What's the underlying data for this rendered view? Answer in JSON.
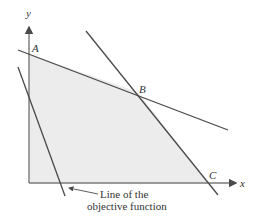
{
  "diagram": {
    "type": "linear-programming-feasible-region",
    "axes": {
      "x_label": "x",
      "y_label": "y"
    },
    "points": {
      "A": "A",
      "B": "B",
      "C": "C"
    },
    "annotation": {
      "line1": "Line of the",
      "line2": "objective function"
    },
    "colors": {
      "region_fill": "#ececec",
      "line": "#4a4a4a",
      "axis": "#7a7a7a",
      "text": "#333333"
    }
  }
}
